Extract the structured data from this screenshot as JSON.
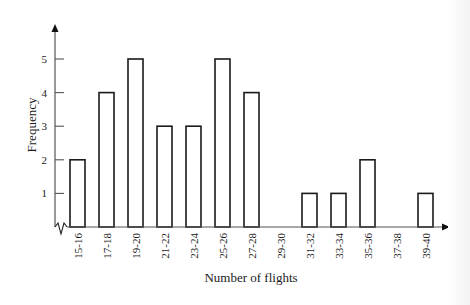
{
  "chart_data": {
    "type": "bar",
    "title": "",
    "xlabel": "Number of flights",
    "ylabel": "Frequency",
    "categories": [
      "15-16",
      "17-18",
      "19-20",
      "21-22",
      "23-24",
      "25-26",
      "27-28",
      "29-30",
      "31-32",
      "33-34",
      "35-36",
      "37-38",
      "39-40"
    ],
    "values": [
      2,
      4,
      5,
      3,
      3,
      5,
      4,
      0,
      1,
      1,
      2,
      0,
      1
    ],
    "yticks": [
      1,
      2,
      3,
      4,
      5
    ],
    "ylim": [
      0,
      5.8
    ],
    "grid": false,
    "legend": null,
    "axis_break_on_x": true
  },
  "layout": {
    "origin_x": 55,
    "origin_y": 227,
    "y_axis_top": 24,
    "x_axis_end": 450,
    "unit_px": 33.6,
    "first_center": 77.5,
    "step": 29.0,
    "bar_width": 15,
    "bar_stroke": "#1a1a1a",
    "bar_fill": "#ffffff",
    "axis_color": "#555555"
  }
}
